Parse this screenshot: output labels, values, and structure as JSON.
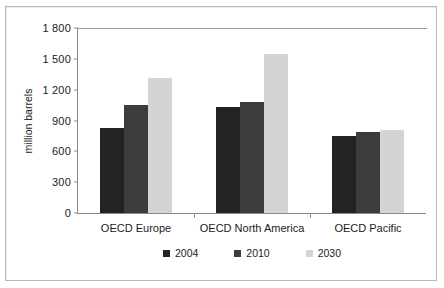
{
  "chart_data": {
    "type": "bar",
    "title": "",
    "subtitle": "",
    "xlabel": "",
    "ylabel": "million barrels",
    "categories": [
      "OECD Europe",
      "OECD North America",
      "OECD Pacific"
    ],
    "series": [
      {
        "name": "2004",
        "color": "#232323",
        "values": [
          830,
          1035,
          745
        ]
      },
      {
        "name": "2010",
        "color": "#3c3c3c",
        "values": [
          1050,
          1085,
          785
        ]
      },
      {
        "name": "2030",
        "color": "#d4d4d4",
        "values": [
          1310,
          1550,
          810
        ]
      }
    ],
    "ylim": [
      0,
      1800
    ],
    "yticks": [
      0,
      300,
      600,
      900,
      1200,
      1500,
      1800
    ],
    "ytick_labels": [
      "0",
      "300",
      "600",
      "900",
      "1 200",
      "1 500",
      "1 800"
    ],
    "grid": false,
    "legend_position": "bottom"
  },
  "axis": {
    "y": {
      "labels": [
        "1 800",
        "1 500",
        "1 200",
        "900",
        "600",
        "300",
        "0"
      ],
      "title": "million barrels"
    },
    "x": {
      "labels": [
        "OECD Europe",
        "OECD North America",
        "OECD Pacific"
      ]
    }
  },
  "legend": {
    "items": [
      {
        "label": "2004"
      },
      {
        "label": "2010"
      },
      {
        "label": "2030"
      }
    ]
  }
}
